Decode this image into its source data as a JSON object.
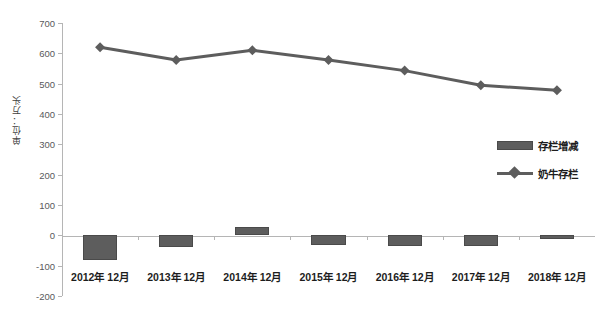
{
  "chart_data": {
    "type": "bar",
    "title": "",
    "subtitle": "",
    "xlabel": "",
    "ylabel": "单位：万头",
    "ylim": [
      -200,
      700
    ],
    "ytick_step": 100,
    "yticks": [
      "700",
      "600",
      "500",
      "400",
      "300",
      "200",
      "100",
      "0",
      "-100",
      "-200"
    ],
    "grid": false,
    "legend_position": "right-middle",
    "categories": [
      "2012年 12月",
      "2013年 12月",
      "2014年 12月",
      "2015年 12月",
      "2016年 12月",
      "2017年 12月",
      "2018年 12月"
    ],
    "series": [
      {
        "name": "存栏增减",
        "type": "bar",
        "color": "#5d5d5d",
        "values": [
          -80,
          -40,
          28,
          -33,
          -35,
          -35,
          -12
        ]
      },
      {
        "name": "奶牛存栏",
        "type": "line",
        "marker": "diamond",
        "color": "#5d5d5d",
        "values": [
          620,
          578,
          610,
          578,
          543,
          495,
          478
        ]
      }
    ]
  },
  "legend": {
    "items": [
      {
        "label": "存栏增减",
        "marker": "bar-swatch"
      },
      {
        "label": "奶牛存栏",
        "marker": "line-diamond"
      }
    ]
  },
  "colors": {
    "series": "#5d5d5d",
    "axis": "#b5b5b5",
    "tick_text": "#59595b",
    "label_text": "#1d1d1d",
    "background": "#ffffff"
  }
}
